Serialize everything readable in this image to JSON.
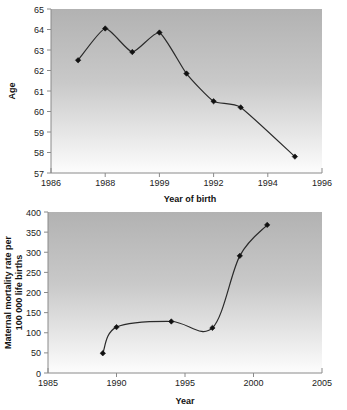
{
  "figure": {
    "background_color": "#ffffff",
    "plot_gradient_top": "#b5b5b5",
    "plot_gradient_bottom": "#fdfdfd",
    "line_color": "#2a2a2a",
    "marker_color": "#111111",
    "axis_color": "#8a8a8a"
  },
  "chart_data": [
    {
      "type": "line",
      "title": "",
      "xlabel": "Year of birth",
      "ylabel": "Age",
      "xlim": [
        1986,
        1996
      ],
      "ylim": [
        57,
        65
      ],
      "xticks": [
        1986,
        1988,
        1990,
        1992,
        1994,
        1996
      ],
      "xtick_labels": [
        "1986",
        "1988",
        "1999",
        "1992",
        "1994",
        "1996"
      ],
      "yticks": [
        57,
        58,
        59,
        60,
        61,
        62,
        63,
        64,
        65
      ],
      "ytick_labels": [
        "57",
        "58",
        "59",
        "60",
        "61",
        "62",
        "63",
        "64",
        "65"
      ],
      "grid": false,
      "legend": "none",
      "x": [
        1987,
        1988,
        1989,
        1990,
        1991,
        1992,
        1993,
        1995
      ],
      "values": [
        62.5,
        64.05,
        62.9,
        63.85,
        61.85,
        60.5,
        60.2,
        57.8
      ],
      "marker": "diamond",
      "note": "x tick label at 1990 position is printed as 1999 in the source scan"
    },
    {
      "type": "line",
      "title": "",
      "xlabel": "Year",
      "ylabel": "Maternal mortality rate per 100 000 life births",
      "ylabel_line1": "Maternal mortality rate per",
      "ylabel_line2": "100 000 life births",
      "xlim": [
        1985,
        2005
      ],
      "ylim": [
        0,
        400
      ],
      "xticks": [
        1985,
        1990,
        1995,
        2000,
        2005
      ],
      "xtick_labels": [
        "1985",
        "1990",
        "1995",
        "2000",
        "2005"
      ],
      "yticks": [
        0,
        50,
        100,
        150,
        200,
        250,
        300,
        350,
        400
      ],
      "ytick_labels": [
        "0",
        "50",
        "100",
        "150",
        "200",
        "250",
        "300",
        "350",
        "400"
      ],
      "grid": false,
      "legend": "none",
      "x": [
        1989,
        1990,
        1994,
        1997,
        1999,
        2001
      ],
      "values": [
        49,
        114,
        128,
        112,
        291,
        368
      ],
      "marker": "diamond",
      "smoothing": "spline"
    }
  ]
}
